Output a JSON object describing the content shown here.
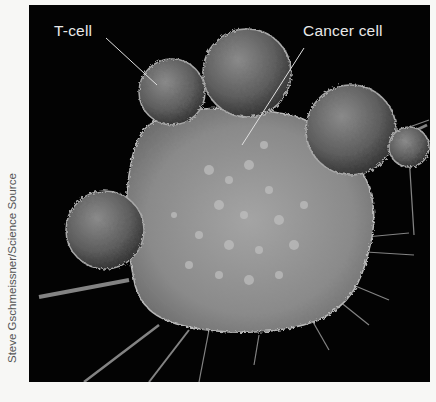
{
  "figure": {
    "labels": {
      "t_cell": "T-cell",
      "cancer_cell": "Cancer cell"
    },
    "credit": "Steve Gschmeissner/Science Source",
    "colors": {
      "background": "#030303",
      "label": "#e8e8e8",
      "page": "#f7f7f5"
    }
  }
}
